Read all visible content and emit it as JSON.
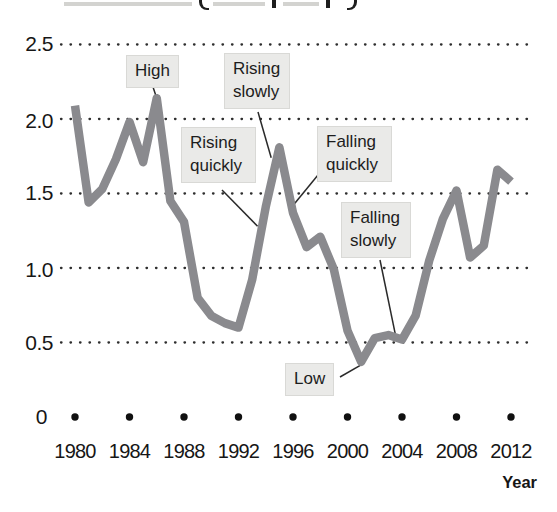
{
  "axis": {
    "x_label": "Year",
    "y_tick_labels": [
      "2.5",
      "2.0",
      "1.5",
      "1.0",
      "0.5",
      "0"
    ],
    "x_tick_labels": [
      "1980",
      "1984",
      "1988",
      "1992",
      "1996",
      "2000",
      "2004",
      "2008",
      "2012"
    ]
  },
  "chart_data": {
    "type": "line",
    "title": "",
    "xlabel": "Year",
    "ylabel": "",
    "ylim": [
      0,
      2.5
    ],
    "xlim": [
      1980,
      2012
    ],
    "grid": "dotted horizontal gridlines at 0.5 intervals; bold dot markers along the zero baseline at each labeled year",
    "legend": "none",
    "line_color": "#8a8a8e",
    "y_ticks": [
      0,
      0.5,
      1.0,
      1.5,
      2.0,
      2.5
    ],
    "x_ticks": [
      1980,
      1984,
      1988,
      1992,
      1996,
      2000,
      2004,
      2008,
      2012
    ],
    "x": [
      1980,
      1981,
      1982,
      1983,
      1984,
      1985,
      1986,
      1987,
      1988,
      1989,
      1990,
      1991,
      1992,
      1993,
      1994,
      1995,
      1996,
      1997,
      1998,
      1999,
      2000,
      2001,
      2002,
      2003,
      2004,
      2005,
      2006,
      2007,
      2008,
      2009,
      2010,
      2011,
      2012
    ],
    "values": [
      2.09,
      1.44,
      1.53,
      1.73,
      1.98,
      1.71,
      2.14,
      1.45,
      1.31,
      0.8,
      0.68,
      0.63,
      0.6,
      0.92,
      1.41,
      1.81,
      1.37,
      1.14,
      1.21,
      0.99,
      0.58,
      0.37,
      0.53,
      0.55,
      0.52,
      0.68,
      1.05,
      1.33,
      1.52,
      1.07,
      1.15,
      1.66,
      1.58
    ],
    "annotations": [
      {
        "label": "High",
        "points_to": {
          "year": 1986,
          "value": 2.14
        }
      },
      {
        "label": "Rising slowly",
        "points_to": {
          "year": 1994.4,
          "value": 1.74
        }
      },
      {
        "label": "Rising quickly",
        "points_to": {
          "year": 1993.4,
          "value": 1.28
        }
      },
      {
        "label": "Falling quickly",
        "points_to": {
          "year": 1996,
          "value": 1.42
        }
      },
      {
        "label": "Falling slowly",
        "points_to": {
          "year": 2003.5,
          "value": 0.56
        }
      },
      {
        "label": "Low",
        "points_to": {
          "year": 2001,
          "value": 0.35
        }
      }
    ]
  }
}
